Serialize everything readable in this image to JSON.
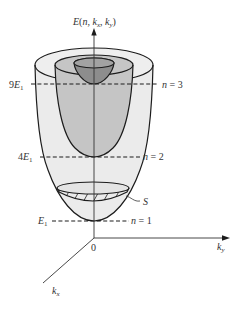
{
  "energy_axis": {
    "symbol": "E",
    "open": "(",
    "n": "n",
    "sep1": ", ",
    "k1": "k",
    "k1_sub": "x",
    "sep2": ", ",
    "k2": "k",
    "k2_sub": "y",
    "close": ")"
  },
  "ky_axis": {
    "symbol": "k",
    "sub": "y"
  },
  "kx_axis": {
    "symbol": "k",
    "sub": "x"
  },
  "origin_label": "0",
  "levels": [
    {
      "coef": "9",
      "symbol": "E",
      "sub": "1",
      "n_var": "n",
      "equals": " = ",
      "n_value": "3"
    },
    {
      "coef": "4",
      "symbol": "E",
      "sub": "1",
      "n_var": "n",
      "equals": " = ",
      "n_value": "2"
    },
    {
      "coef": "",
      "symbol": "E",
      "sub": "1",
      "n_var": "n",
      "equals": " = ",
      "n_value": "1"
    }
  ],
  "surface_label": "S",
  "colors": {
    "outer_surface": "#ebebeb",
    "outer_top": "#eeeeee",
    "middle_surface": "#c5c5c5",
    "inner_surface": "#8d8d8d",
    "inner_top": "#a2a2a2",
    "disc": "#e4e4e4",
    "outline": "#1c1c1c",
    "axis": "#333333"
  }
}
